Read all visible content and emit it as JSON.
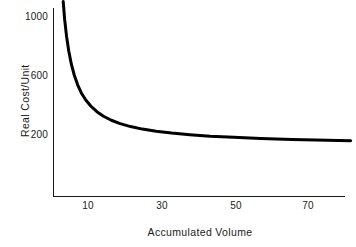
{
  "chart_data": {
    "type": "line",
    "title": "",
    "xlabel": "Accumulated Volume",
    "ylabel": "Real Cost/Unit",
    "xlim": [
      3,
      82
    ],
    "ylim": [
      0,
      1120
    ],
    "xticks": [
      10,
      30,
      50,
      70
    ],
    "xtick_labels": [
      "10",
      "30",
      "50",
      "70"
    ],
    "yticks": [
      200,
      600,
      1000
    ],
    "ytick_labels": [
      "200",
      "600",
      "1000"
    ],
    "grid": false,
    "legend": false,
    "series": [
      {
        "name": "Real Cost/Unit",
        "color": "#000000",
        "linewidth": 3,
        "x": [
          3.3,
          3.7,
          4.2,
          4.8,
          5.5,
          6.3,
          7.2,
          8.2,
          9.4,
          10.8,
          12.4,
          14.2,
          16.3,
          18.7,
          21.5,
          24.7,
          28.4,
          32.6,
          37.5,
          43.0,
          49.4,
          56.7,
          65.1,
          74.7,
          81.0
        ],
        "y": [
          1105,
          980,
          870,
          770,
          680,
          605,
          540,
          485,
          437,
          395,
          358,
          327,
          300,
          277,
          257,
          240,
          226,
          213,
          202,
          192,
          184,
          176,
          170,
          164,
          161
        ]
      }
    ],
    "annotations": [],
    "axis_color": "#1a1a1a",
    "background": "#ffffff"
  },
  "figure": {
    "width": "356",
    "height": "247"
  }
}
